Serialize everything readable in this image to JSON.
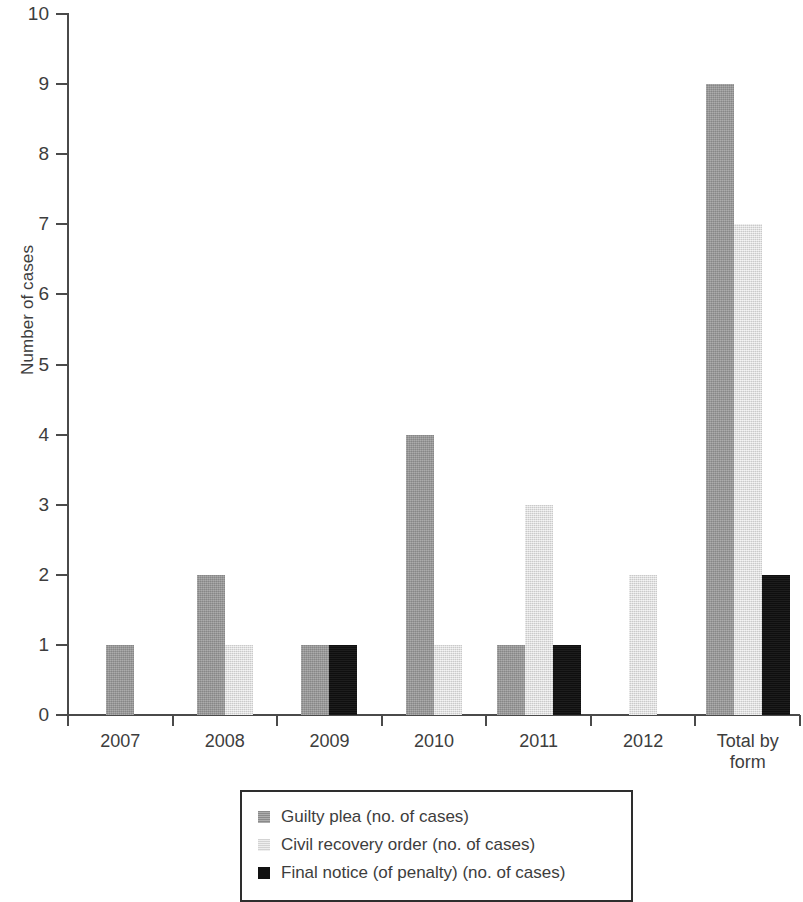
{
  "chart_data": {
    "type": "bar",
    "title": "",
    "xlabel": "",
    "ylabel": "Number of cases",
    "ylim": [
      0,
      10
    ],
    "ytick_labels": [
      "10",
      "9",
      "8",
      "7",
      "6",
      "5",
      "4",
      "3",
      "2",
      "1",
      "0"
    ],
    "ytick_values": [
      10,
      9,
      8,
      7,
      6,
      5,
      4,
      3,
      2,
      1,
      0
    ],
    "grid": false,
    "legend_position": "bottom",
    "categories": [
      "2007",
      "2008",
      "2009",
      "2010",
      "2011",
      "2012",
      "Total by form"
    ],
    "category_label_lines": [
      [
        "2007"
      ],
      [
        "2008"
      ],
      [
        "2009"
      ],
      [
        "2010"
      ],
      [
        "2011"
      ],
      [
        "2012"
      ],
      [
        "Total by",
        "form"
      ]
    ],
    "series": [
      {
        "name": "Guilty plea (no. of cases)",
        "color": "#9a9a9a",
        "values": [
          1,
          2,
          1,
          4,
          1,
          0,
          9
        ]
      },
      {
        "name": "Civil recovery order (no. of cases)",
        "color": "#dedede",
        "values": [
          0,
          1,
          0,
          1,
          3,
          2,
          7
        ]
      },
      {
        "name": "Final notice (of penalty) (no. of cases)",
        "color": "#111111",
        "values": [
          0,
          0,
          1,
          0,
          1,
          0,
          2
        ]
      }
    ]
  }
}
